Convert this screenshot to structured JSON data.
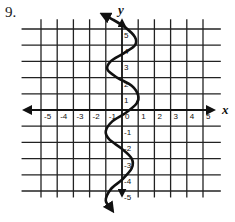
{
  "problem": {
    "number": "9."
  },
  "chart_data": {
    "type": "line",
    "title": "",
    "xlabel": "x",
    "ylabel": "y",
    "xlim": [
      -6,
      6
    ],
    "ylim": [
      -6,
      6
    ],
    "grid": true,
    "x_ticks": [
      -5,
      -4,
      -3,
      -2,
      -1,
      0,
      1,
      2,
      3,
      4,
      5
    ],
    "y_ticks": [
      -5,
      -4,
      -3,
      -2,
      -1,
      1,
      2,
      3,
      4,
      5
    ],
    "x_tick_labels": [
      "-5",
      "-4",
      "-3",
      "-2",
      "-1",
      "0",
      "1",
      "2",
      "3",
      "4",
      "5"
    ],
    "y_tick_labels": [
      "-5",
      "-4",
      "-3",
      "-2",
      "-1",
      "1",
      "2",
      "3",
      "4",
      "5"
    ],
    "series": [
      {
        "name": "curve",
        "description": "Sinusoidal curve oscillating horizontally about the y-axis (x as a periodic function of y), with arrowheads at both ends",
        "points": [
          [
            -0.6,
            -6.2
          ],
          [
            -1.0,
            -5.6
          ],
          [
            -0.7,
            -4.9
          ],
          [
            0.0,
            -4.3
          ],
          [
            0.6,
            -3.6
          ],
          [
            0.6,
            -3.0
          ],
          [
            0.0,
            -2.4
          ],
          [
            -0.8,
            -1.8
          ],
          [
            -1.0,
            -1.3
          ],
          [
            -0.6,
            -0.7
          ],
          [
            0.2,
            -0.2
          ],
          [
            0.9,
            0.4
          ],
          [
            1.0,
            0.9
          ],
          [
            0.6,
            1.5
          ],
          [
            -0.3,
            2.0
          ],
          [
            -0.9,
            2.5
          ],
          [
            -0.7,
            3.0
          ],
          [
            0.1,
            3.5
          ],
          [
            0.8,
            4.0
          ],
          [
            0.8,
            4.5
          ],
          [
            0.2,
            5.1
          ],
          [
            -0.6,
            5.6
          ],
          [
            -1.2,
            5.9
          ]
        ],
        "color": "#111111",
        "arrows": "both"
      }
    ]
  }
}
